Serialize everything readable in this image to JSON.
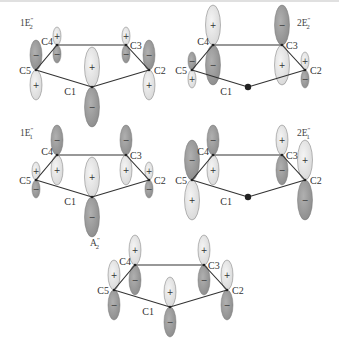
{
  "diagram": {
    "colors": {
      "positive_lobe": "#d6d6d6",
      "negative_lobe": "#8a8a8a",
      "bond": "#333333",
      "node_atom": "#222222",
      "background": "#ffffff"
    },
    "atoms": [
      "C1",
      "C2",
      "C3",
      "C4",
      "C5"
    ],
    "panels": [
      {
        "id": "1E2pp",
        "label": "1E″₂",
        "label_main": "1E",
        "label_sup": "″",
        "label_sub": "2",
        "origin": [
          0,
          0
        ],
        "lobes": {
          "C1": {
            "top": "+",
            "bottom": "−",
            "size": "large"
          },
          "C2": {
            "top": "−",
            "bottom": "+",
            "size": "medium"
          },
          "C3": {
            "top": "+",
            "bottom": "−",
            "size": "small"
          },
          "C4": {
            "top": "+",
            "bottom": "−",
            "size": "small"
          },
          "C5": {
            "top": "−",
            "bottom": "+",
            "size": "medium"
          }
        }
      },
      {
        "id": "2E2pp",
        "label": "2E″₂",
        "label_main": "2E",
        "label_sup": "″",
        "label_sub": "2",
        "origin": [
          156,
          0
        ],
        "lobes": {
          "C1": {
            "node": true
          },
          "C2": {
            "top": "+",
            "bottom": "−",
            "size": "small"
          },
          "C3": {
            "top": "−",
            "bottom": "+",
            "size": "large"
          },
          "C4": {
            "top": "+",
            "bottom": "−",
            "size": "large"
          },
          "C5": {
            "top": "−",
            "bottom": "+",
            "size": "small"
          }
        }
      },
      {
        "id": "1E1pp",
        "label": "1E″₁",
        "label_main": "1E",
        "label_sup": "″",
        "label_sub": "1",
        "origin": [
          0,
          110
        ],
        "lobes": {
          "C1": {
            "top": "+",
            "bottom": "−",
            "size": "large"
          },
          "C2": {
            "top": "+",
            "bottom": "−",
            "size": "small"
          },
          "C3": {
            "top": "−",
            "bottom": "+",
            "size": "medium"
          },
          "C4": {
            "top": "−",
            "bottom": "+",
            "size": "medium"
          },
          "C5": {
            "top": "+",
            "bottom": "−",
            "size": "small"
          }
        }
      },
      {
        "id": "2E1pp",
        "label": "2E″₁",
        "label_main": "2E",
        "label_sup": "″",
        "label_sub": "1",
        "origin": [
          156,
          110
        ],
        "lobes": {
          "C1": {
            "node": true
          },
          "C2": {
            "top": "+",
            "bottom": "−",
            "size": "large"
          },
          "C3": {
            "top": "+",
            "bottom": "−",
            "size": "medium"
          },
          "C4": {
            "top": "−",
            "bottom": "+",
            "size": "medium"
          },
          "C5": {
            "top": "−",
            "bottom": "+",
            "size": "large"
          }
        }
      },
      {
        "id": "A2pp",
        "label": "A″₂",
        "label_main": "A",
        "label_sup": "″",
        "label_sub": "2",
        "origin": [
          78,
          220
        ],
        "lobes": {
          "C1": {
            "top": "+",
            "bottom": "−",
            "size": "medium"
          },
          "C2": {
            "top": "+",
            "bottom": "−",
            "size": "medium"
          },
          "C3": {
            "top": "+",
            "bottom": "−",
            "size": "medium"
          },
          "C4": {
            "top": "+",
            "bottom": "−",
            "size": "medium"
          },
          "C5": {
            "top": "+",
            "bottom": "−",
            "size": "medium"
          }
        }
      }
    ]
  }
}
